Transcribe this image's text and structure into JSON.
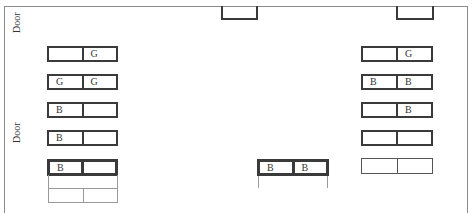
{
  "labels": {
    "door_top": "Door",
    "door_mid": "Door"
  },
  "left_column": [
    {
      "seats": [
        "",
        "G"
      ]
    },
    {
      "seats": [
        "G",
        "G"
      ]
    },
    {
      "seats": [
        "B",
        ""
      ]
    },
    {
      "seats": [
        "B",
        ""
      ]
    },
    {
      "seats": [
        "B",
        ""
      ]
    }
  ],
  "right_column": [
    {
      "seats": [
        "",
        "G"
      ]
    },
    {
      "seats": [
        "B",
        "B"
      ]
    },
    {
      "seats": [
        "",
        "B"
      ]
    },
    {
      "seats": [
        "",
        ""
      ]
    },
    {
      "seats": [
        "",
        ""
      ]
    }
  ],
  "center_desk": {
    "seats": [
      "B",
      "B"
    ]
  }
}
